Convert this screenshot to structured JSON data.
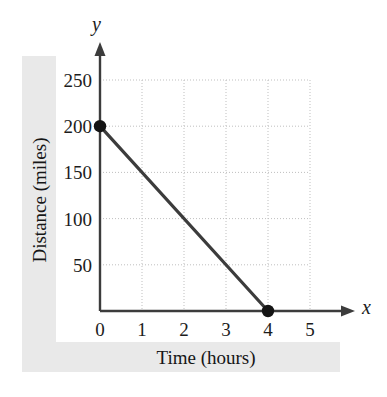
{
  "chart_data": {
    "type": "line",
    "title": "",
    "xlabel": "Time (hours)",
    "ylabel": "Distance (miles)",
    "x_axis_variable": "x",
    "y_axis_variable": "y",
    "xlim": [
      0,
      5.6
    ],
    "ylim": [
      0,
      270
    ],
    "xticks": [
      0,
      1,
      2,
      3,
      4,
      5
    ],
    "xtick_labels": [
      "0",
      "1",
      "2",
      "3",
      "4",
      "5"
    ],
    "yticks": [
      50,
      100,
      150,
      200,
      250
    ],
    "ytick_labels": [
      "50",
      "100",
      "150",
      "200",
      "250"
    ],
    "grid": true,
    "grid_style": "dotted",
    "legend": null,
    "series": [
      {
        "name": "Distance remaining",
        "x": [
          0,
          4
        ],
        "values": [
          200,
          0
        ],
        "marked_points": [
          {
            "x": 0,
            "y": 200
          },
          {
            "x": 4,
            "y": 0
          }
        ],
        "slope": -50,
        "intercept": 200,
        "line_color": "#3c3c3c",
        "marker_color": "#141414"
      }
    ]
  },
  "figure": {
    "axis_color": "#3c3c3c",
    "grid_color": "#bfbfbf",
    "band_color": "#e9e9e9",
    "background": "#ffffff"
  }
}
